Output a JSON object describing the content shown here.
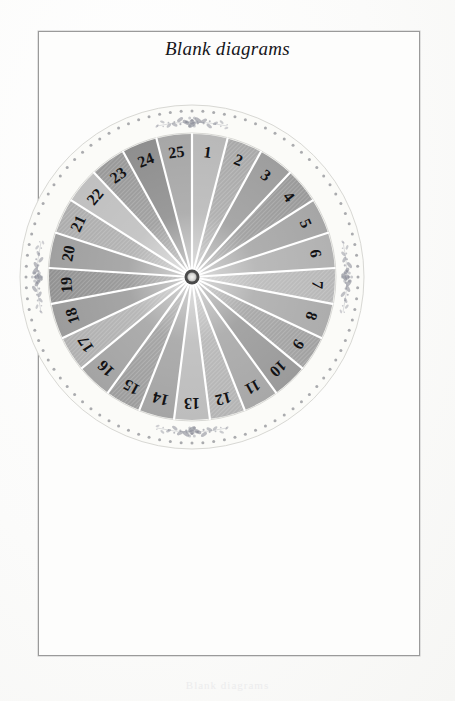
{
  "page": {
    "title": "Blank diagrams",
    "bottom_caption": "Blank diagrams",
    "border_color": "#9a9a9a",
    "background_color": "#fdfdfc"
  },
  "diagram": {
    "name": "blank-rose-wheel-25",
    "sector_count": 25,
    "hub_outer_color": "#4a4a4a",
    "hub_inner_color": "#e8e8e6",
    "divider_color": "#ffffff",
    "ring_band_color": "#fbfbf8",
    "ring_dot_color": "#8f9096",
    "ring_dot_count": 96,
    "ornament_color": "#8b8d98",
    "ornament_positions": [
      "top",
      "right",
      "bottom",
      "left"
    ],
    "label_color": "#121214",
    "labels": [
      "1",
      "2",
      "3",
      "4",
      "5",
      "6",
      "7",
      "8",
      "9",
      "10",
      "11",
      "12",
      "13",
      "14",
      "15",
      "16",
      "17",
      "18",
      "19",
      "20",
      "21",
      "22",
      "23",
      "24",
      "25"
    ],
    "sector_fills": [
      "#b9b9b9",
      "#a9a9a9",
      "#9e9e9e",
      "#9a9a9a",
      "#a6a6a6",
      "#b2b2b2",
      "#b8b8b8",
      "#adadad",
      "#a2a2a2",
      "#9b9b9b",
      "#a8a8a8",
      "#b4b4b4",
      "#bdbdbd",
      "#a5a5a5",
      "#9d9d9d",
      "#a4a4a4",
      "#b0b0b0",
      "#9c9c9c",
      "#929292",
      "#a0a0a0",
      "#adadad",
      "#c0c0c0",
      "#999999",
      "#8f8f8f",
      "#a7a7a7"
    ],
    "sector_textures": [
      "plain",
      "hatch",
      "plain",
      "hatch",
      "plain",
      "plain",
      "hatch",
      "plain",
      "hatch",
      "plain",
      "plain",
      "hatch",
      "plain",
      "plain",
      "hatch",
      "plain",
      "hatch",
      "plain",
      "hatch",
      "plain",
      "hatch",
      "plain",
      "hatch",
      "plain",
      "plain"
    ]
  }
}
